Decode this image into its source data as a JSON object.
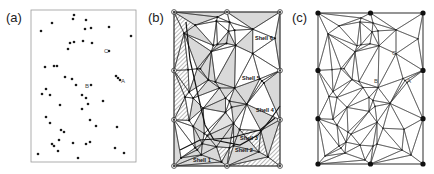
{
  "figure": {
    "panels": [
      {
        "id": "a",
        "label": "(a)",
        "description": "Scattered point set",
        "point_labels": [
          "A",
          "B",
          "C"
        ]
      },
      {
        "id": "b",
        "label": "(b)",
        "description": "Shelling triangulation with shaded and hatched shells",
        "shell_labels": [
          "Shell 1",
          "Shell 2",
          "Shell 3",
          "Shell 4",
          "Shell 5",
          "Shell 6"
        ]
      },
      {
        "id": "c",
        "label": "(c)",
        "description": "Triangulated network with boundary nodes",
        "point_labels": [
          "A",
          "B",
          "C"
        ]
      }
    ],
    "colors": {
      "ink": "#1a1a1a",
      "frame": "#9a9a9a",
      "shade": "#d9d9d9",
      "hatch": "#333333"
    }
  }
}
